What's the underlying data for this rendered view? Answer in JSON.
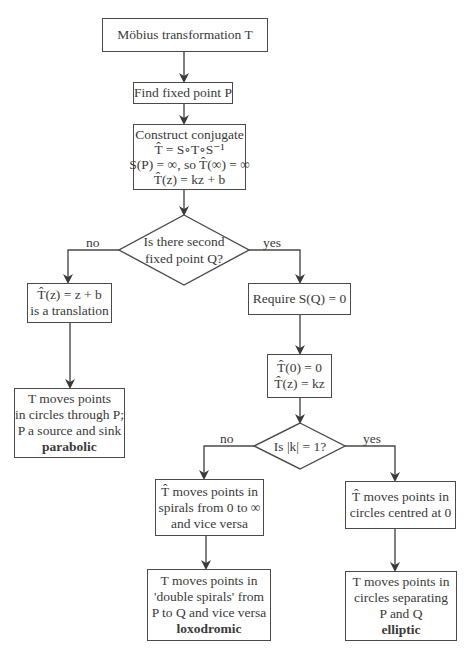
{
  "diagram": {
    "nodes": {
      "start": {
        "lines": [
          "Möbius transformation T"
        ]
      },
      "fixed_point": {
        "lines": [
          "Find fixed point P"
        ]
      },
      "conjugate": {
        "lines": [
          "Construct conjugate",
          "T̂ = S∘T∘S⁻¹",
          "S(P) = ∞, so T̂(∞) = ∞",
          "T̂(z) = kz + b"
        ]
      },
      "decision_q": {
        "lines": [
          "Is there second",
          "fixed point Q?"
        ]
      },
      "translation": {
        "lines": [
          "T̂(z) = z + b",
          "is a translation"
        ]
      },
      "require": {
        "lines": [
          "Require S(Q) = 0"
        ]
      },
      "parabolic": {
        "lines": [
          "T moves points",
          "in circles through P;",
          "P a source and sink"
        ],
        "classification": "parabolic"
      },
      "kz": {
        "lines": [
          "T̂(0) = 0",
          "T̂(z) = kz"
        ]
      },
      "decision_k": {
        "lines": [
          "Is |k| = 1?"
        ]
      },
      "spirals": {
        "lines": [
          "T̂ moves points in",
          "spirals from 0 to ∞",
          "and vice versa"
        ]
      },
      "circles": {
        "lines": [
          "T̂ moves points in",
          "circles centred at 0"
        ]
      },
      "loxodromic": {
        "lines": [
          "T moves points in",
          "'double spirals' from",
          "P to Q and vice versa"
        ],
        "classification": "loxodromic"
      },
      "elliptic": {
        "lines": [
          "T moves points in",
          "circles separating",
          "P and Q"
        ],
        "classification": "elliptic"
      }
    },
    "edge_labels": {
      "q_no": "no",
      "q_yes": "yes",
      "k_no": "no",
      "k_yes": "yes"
    },
    "colors": {
      "stroke": "#4a4a4a",
      "text": "#3a3a3a",
      "background": "#ffffff"
    }
  }
}
